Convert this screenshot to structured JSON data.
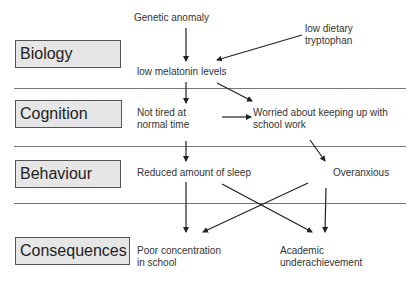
{
  "levels": [
    {
      "label": "Biology"
    },
    {
      "label": "Cognition"
    },
    {
      "label": "Behaviour"
    },
    {
      "label": "Consequences"
    }
  ],
  "nodes": {
    "genetic_anomaly": "Genetic anomaly",
    "low_tryptophan_1": "low dietary",
    "low_tryptophan_2": "tryptophan",
    "low_melatonin": "low melatonin levels",
    "not_tired_1": "Not tired at",
    "not_tired_2": "normal time",
    "worried_1": "Worried about keeping up with",
    "worried_2": "school work",
    "reduced_sleep": "Reduced amount of sleep",
    "overanxious": "Overanxious",
    "poor_concentration_1": "Poor concentration",
    "poor_concentration_2": "in school",
    "academic_1": "Academic",
    "academic_2": "underachievement"
  },
  "edges": [
    {
      "from": "Genetic anomaly",
      "to": "low melatonin levels"
    },
    {
      "from": "low dietary tryptophan",
      "to": "low melatonin levels"
    },
    {
      "from": "low melatonin levels",
      "to": "Not tired at normal time"
    },
    {
      "from": "low melatonin levels",
      "to": "Worried about keeping up with school work"
    },
    {
      "from": "Not tired at normal time",
      "to": "Worried about keeping up with school work"
    },
    {
      "from": "Not tired at normal time",
      "to": "Reduced amount of sleep"
    },
    {
      "from": "Worried about keeping up with school work",
      "to": "Overanxious"
    },
    {
      "from": "Reduced amount of sleep",
      "to": "Poor concentration in school"
    },
    {
      "from": "Reduced amount of sleep",
      "to": "Academic underachievement"
    },
    {
      "from": "Overanxious",
      "to": "Poor concentration in school"
    },
    {
      "from": "Overanxious",
      "to": "Academic underachievement"
    }
  ]
}
